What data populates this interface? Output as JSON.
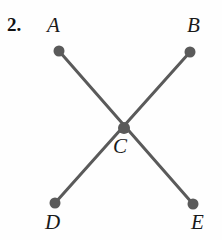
{
  "figure": {
    "problem_number": "2.",
    "type": "line-diagram",
    "background_color": "#fefefe",
    "stroke_color": "#5a5a5a",
    "label_color": "#1a1a1a",
    "line_width": 3,
    "dot_radius": 5.5,
    "center_dot_radius": 6,
    "canvas": {
      "width": 222,
      "height": 240
    },
    "points": [
      {
        "id": "A",
        "label": "A",
        "x": 59,
        "y": 51,
        "label_x": 47,
        "label_y": 15
      },
      {
        "id": "B",
        "label": "B",
        "x": 190,
        "y": 52,
        "label_x": 187,
        "label_y": 15
      },
      {
        "id": "C",
        "label": "C",
        "x": 124,
        "y": 128,
        "label_x": 113,
        "label_y": 136
      },
      {
        "id": "D",
        "label": "D",
        "x": 55,
        "y": 203,
        "label_x": 45,
        "label_y": 212
      },
      {
        "id": "E",
        "label": "E",
        "x": 193,
        "y": 204,
        "label_x": 191,
        "label_y": 212
      }
    ],
    "segments": [
      {
        "id": "A-E",
        "from": "A",
        "to": "E",
        "x1": 59,
        "y1": 51,
        "x2": 193,
        "y2": 204
      },
      {
        "id": "B-D",
        "from": "B",
        "to": "D",
        "x1": 190,
        "y1": 52,
        "x2": 55,
        "y2": 203
      }
    ]
  }
}
